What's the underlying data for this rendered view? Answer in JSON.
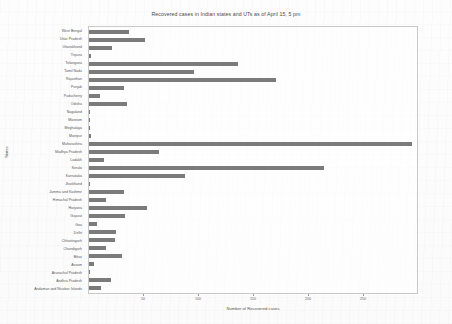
{
  "chart_data": {
    "type": "bar",
    "orientation": "horizontal",
    "title": "Recovered cases in Indian states and UTs as of April 15, 5 pm",
    "xlabel": "Number of Recovered cases",
    "ylabel": "States",
    "xlim": [
      0,
      300
    ],
    "xticks": [
      50,
      100,
      150,
      200,
      250
    ],
    "grid": false,
    "legend": null,
    "bar_color": "#7b7b7b",
    "categories": [
      "West Bengal",
      "Uttar Pradesh",
      "Uttarakhand",
      "Tripura",
      "Telangana",
      "Tamil Nadu",
      "Rajasthan",
      "Punjab",
      "Puducherry",
      "Odisha",
      "Nagaland",
      "Mizoram",
      "Meghalaya",
      "Manipur",
      "Maharashtra",
      "Madhya Pradesh",
      "Ladakh",
      "Kerala",
      "Karnataka",
      "Jharkhand",
      "Jammu and Kashmir",
      "Himachal Pradesh",
      "Haryana",
      "Gujarat",
      "Goa",
      "Delhi",
      "Chhattisgarh",
      "Chandigarh",
      "Bihar",
      "Assam",
      "Arunachal Pradesh",
      "Andhra Pradesh",
      "Andaman and Nicobar Islands"
    ],
    "values": [
      37,
      51,
      21,
      2,
      136,
      96,
      171,
      32,
      10,
      35,
      0,
      1,
      0,
      2,
      295,
      64,
      14,
      215,
      88,
      0,
      32,
      16,
      53,
      33,
      7,
      25,
      24,
      16,
      30,
      5,
      1,
      20,
      11
    ]
  }
}
